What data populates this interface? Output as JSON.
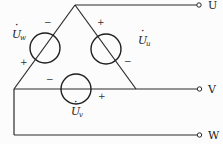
{
  "diagram": {
    "type": "delta-connected three-phase voltage sources",
    "colors": {
      "line": "#2a2a2a",
      "background": "#fcfcfc"
    },
    "terminals": [
      {
        "id": "U",
        "label": "U"
      },
      {
        "id": "V",
        "label": "V"
      },
      {
        "id": "W",
        "label": "W"
      }
    ],
    "sources": [
      {
        "id": "w",
        "symbol": "U",
        "accent": "·",
        "subscript": "w",
        "polarity_top": "−",
        "polarity_bottom": "+"
      },
      {
        "id": "u",
        "symbol": "U",
        "accent": "·",
        "subscript": "u",
        "polarity_top": "+",
        "polarity_bottom": "−"
      },
      {
        "id": "v",
        "symbol": "U",
        "accent": "·",
        "subscript": "v",
        "polarity_left": "−",
        "polarity_right": "+"
      }
    ]
  }
}
